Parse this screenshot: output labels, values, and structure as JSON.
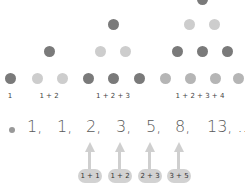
{
  "diagram": {
    "groups": [
      {
        "label": "1"
      },
      {
        "label": "1 + 2"
      },
      {
        "label": "1 + 2 + 3"
      },
      {
        "label": "1 + 2 + 3 + 4"
      }
    ],
    "sequence": [
      "1,",
      "1,",
      "2,",
      "3,",
      "5,",
      "8,",
      "13, ..."
    ],
    "sums": [
      "1 + 1",
      "1 + 2",
      "2 + 3",
      "3 + 5"
    ],
    "colors": {
      "dark_dot": "#7a7a7a",
      "light_dot": "#cdcdcd",
      "arrow": "#cfcfcf",
      "pill": "#d2d2d2"
    }
  }
}
